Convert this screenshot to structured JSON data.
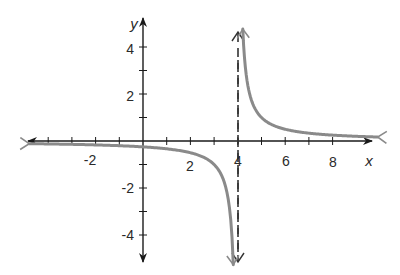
{
  "chart_data": {
    "type": "line",
    "title": "",
    "function": "y = 1/(x - 4)",
    "xlabel": "x",
    "ylabel": "y",
    "xlim": [
      -5,
      9.8
    ],
    "ylim": [
      -5.4,
      5
    ],
    "x_ticks": [
      -4,
      -3,
      -2,
      -1,
      1,
      2,
      3,
      4,
      5,
      6,
      7,
      8
    ],
    "x_tick_labels": [
      "-2",
      "2",
      "4",
      "6",
      "8"
    ],
    "x_tick_label_values": [
      -2,
      2,
      4,
      6,
      8
    ],
    "y_ticks": [
      -4,
      -3,
      -2,
      -1,
      1,
      2,
      3,
      4
    ],
    "y_tick_labels": [
      "4",
      "2",
      "-2",
      "-4"
    ],
    "y_tick_label_values": [
      4,
      2,
      -2,
      -4
    ],
    "grid": false,
    "asymptotes": [
      {
        "type": "vertical",
        "x": 4,
        "style": "dashed",
        "color": "#333333"
      },
      {
        "type": "horizontal",
        "y": 0,
        "style": "x-axis"
      }
    ],
    "series": [
      {
        "name": "left-branch",
        "color": "#8a8a8a",
        "x": [
          -4.8,
          -4,
          -3,
          -2,
          -1,
          0,
          1,
          2,
          3,
          3.5,
          3.7,
          3.8,
          3.85
        ],
        "y": [
          -0.114,
          -0.125,
          -0.143,
          -0.167,
          -0.2,
          -0.25,
          -0.333,
          -0.5,
          -1,
          -2,
          -3.33,
          -5,
          -6.67
        ]
      },
      {
        "name": "right-branch",
        "color": "#8a8a8a",
        "x": [
          4.21,
          4.3,
          4.5,
          5,
          6,
          7,
          8,
          9,
          9.8
        ],
        "y": [
          4.76,
          3.33,
          2,
          1,
          0.5,
          0.333,
          0.25,
          0.2,
          0.172
        ]
      }
    ]
  },
  "labels": {
    "x_axis": "x",
    "y_axis": "y",
    "x_ticks": {
      "m2": "-2",
      "p2": "2",
      "p4": "4",
      "p6": "6",
      "p8": "8"
    },
    "y_ticks": {
      "p4": "4",
      "p2": "2",
      "m2": "-2",
      "m4": "-4"
    }
  },
  "colors": {
    "axis": "#1a1a1a",
    "curve": "#8a8a8a",
    "asymptote": "#333333"
  }
}
